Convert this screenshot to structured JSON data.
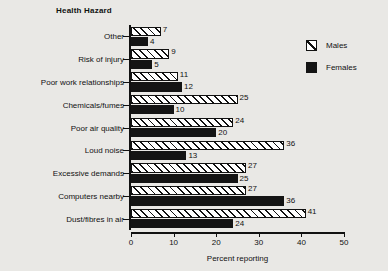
{
  "chart_data": {
    "type": "bar",
    "orientation": "horizontal",
    "title": "Health Hazard",
    "xlabel": "Percent reporting",
    "ylabel": "",
    "xlim": [
      0,
      50
    ],
    "xticks": [
      0,
      10,
      20,
      30,
      40,
      50
    ],
    "grid": false,
    "legend_position": "top-right",
    "categories": [
      "Other",
      "Risk of injury",
      "Poor work relationships",
      "Chemicals/fumes",
      "Poor air quality",
      "Loud noise",
      "Excessive demands",
      "Computers nearby",
      "Dust/fibres in air"
    ],
    "series": [
      {
        "name": "Males",
        "values": [
          7,
          9,
          11,
          25,
          24,
          36,
          27,
          27,
          41
        ]
      },
      {
        "name": "Females",
        "values": [
          4,
          5,
          12,
          10,
          20,
          13,
          25,
          36,
          24
        ]
      }
    ],
    "data_labels": {
      "males": [
        "7",
        "9",
        "11",
        "25",
        "24",
        "36",
        "27",
        "27",
        "41"
      ],
      "females": [
        "4",
        "5",
        "12",
        "10",
        "20",
        "13",
        "25",
        "36",
        "24"
      ]
    }
  },
  "legend": {
    "items": [
      {
        "label": "Males",
        "swatch": "hatched-box-icon"
      },
      {
        "label": "Females",
        "swatch": "solid-black-box-icon"
      }
    ]
  },
  "colors": {
    "background": "#e9e8e5",
    "ink": "#111111",
    "males_fill": "#ffffff",
    "females_fill": "#141414"
  }
}
